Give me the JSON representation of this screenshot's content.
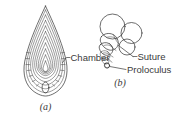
{
  "figure": {
    "background_color": "#ffffff",
    "ink_color": "#2e2e2e",
    "text_color": "#3a3a3a",
    "panels": [
      {
        "caption": "(a)",
        "name": "fusiform-test",
        "description": "fusiform foraminifera test in axial section with nested chamber outlines"
      },
      {
        "caption": "(b)",
        "name": "trochospiral-test",
        "description": "trochospiral foraminifera test with circular chambers spiralling to the proloculus"
      }
    ],
    "labels": [
      {
        "text": "Chamber",
        "name": "chamber"
      },
      {
        "text": "Suture",
        "name": "suture"
      },
      {
        "text": "Proloculus",
        "name": "proloculus"
      }
    ]
  }
}
